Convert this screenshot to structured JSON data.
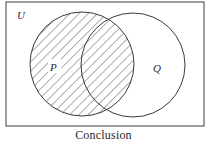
{
  "diagram": {
    "type": "venn",
    "universe_label": "U",
    "caption": "Conclusion",
    "sets": [
      {
        "label": "P",
        "cx": 82,
        "cy": 64,
        "r": 52,
        "shaded": true
      },
      {
        "label": "Q",
        "cx": 133,
        "cy": 65,
        "r": 52,
        "shaded": false
      }
    ],
    "shaded_region": "P",
    "colors": {
      "stroke": "#3a3a3a",
      "hatch": "#4a4a4a",
      "background": "#ffffff"
    }
  }
}
